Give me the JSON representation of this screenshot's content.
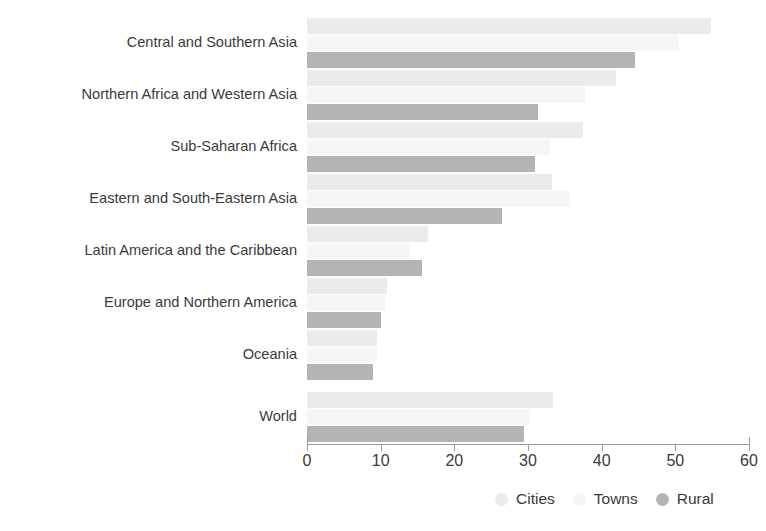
{
  "chart_data": {
    "type": "bar",
    "orientation": "horizontal",
    "title": "",
    "xlabel": "",
    "ylabel": "",
    "xlim": [
      0,
      60
    ],
    "xticks": [
      0,
      10,
      20,
      30,
      40,
      50,
      60
    ],
    "xtick_labels": [
      "0",
      "10",
      "20",
      "30",
      "40",
      "50",
      "60"
    ],
    "grid": false,
    "legend_position": "bottom-right",
    "categories": [
      "Central and Southern Asia",
      "Northern Africa and Western Asia",
      "Sub-Saharan Africa",
      "Eastern and South-Eastern Asia",
      "Latin America and the Caribbean",
      "Europe and Northern America",
      "Oceania",
      "World"
    ],
    "series": [
      {
        "name": "Cities",
        "color": "#ebebeb",
        "values": [
          54.8,
          42.0,
          37.5,
          33.3,
          16.4,
          10.9,
          9.5,
          33.4
        ]
      },
      {
        "name": "Towns",
        "color": "#f6f6f6",
        "values": [
          50.5,
          37.7,
          33.0,
          35.7,
          14.0,
          10.6,
          9.5,
          30.3
        ]
      },
      {
        "name": "Rural",
        "color": "#b4b4b4",
        "values": [
          44.5,
          31.4,
          31.0,
          26.5,
          15.6,
          10.0,
          8.9,
          29.4
        ]
      }
    ]
  },
  "legend": {
    "items": [
      {
        "label": "Cities",
        "marker": "circle-marker-cities"
      },
      {
        "label": "Towns",
        "marker": "circle-marker-towns"
      },
      {
        "label": "Rural",
        "marker": "circle-marker-rural"
      }
    ]
  },
  "title_clip": {
    "text": ""
  }
}
